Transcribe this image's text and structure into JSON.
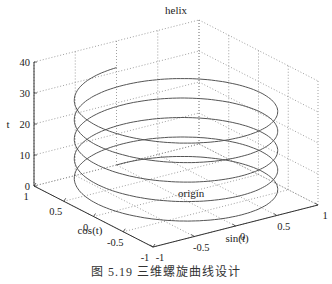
{
  "caption": "图 5.19   三维螺旋曲线设计",
  "chart_data": {
    "type": "line3d",
    "title": "helix",
    "xlabel": "cos(t)",
    "ylabel": "sin(t)",
    "zlabel": "t",
    "annotation": {
      "text": "origin",
      "at": [
        0,
        0,
        0
      ]
    },
    "x_ticks": [
      1,
      0.5,
      0,
      -0.5,
      -1
    ],
    "y_ticks": [
      -1,
      -0.5,
      0,
      0.5,
      1
    ],
    "z_ticks": [
      0,
      10,
      20,
      30,
      40
    ],
    "xlim": [
      -1,
      1
    ],
    "ylim": [
      -1,
      1
    ],
    "zlim": [
      0,
      40
    ],
    "grid": true,
    "series": [
      {
        "name": "helix",
        "x_expr": "cos(t)",
        "y_expr": "sin(t)",
        "z_expr": "t",
        "t_range": [
          0,
          31.4159
        ],
        "color": "#555555"
      }
    ]
  },
  "colors": {
    "axis": "#333333",
    "grid": "#888888",
    "curve": "#555555"
  }
}
